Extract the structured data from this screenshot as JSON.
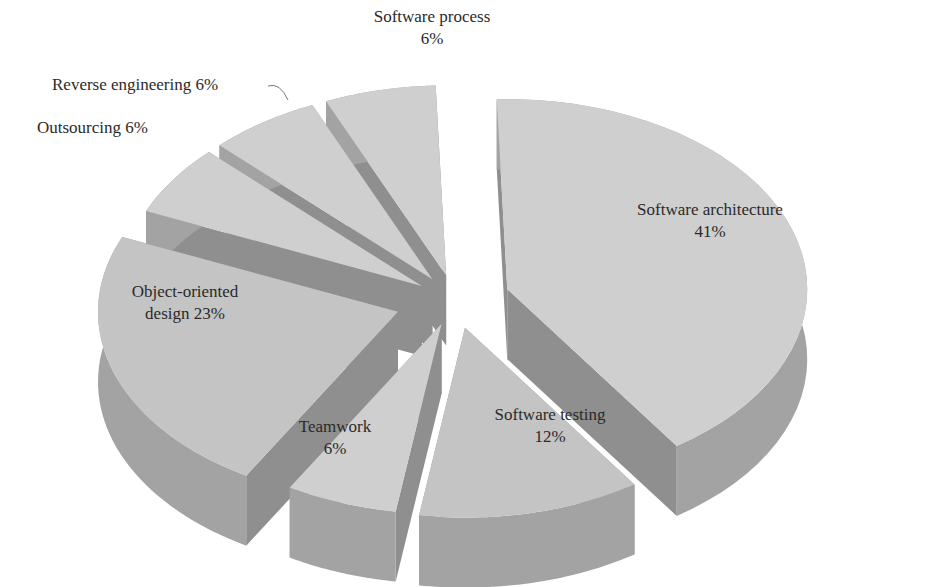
{
  "chart_data": {
    "type": "pie",
    "style": "3d-exploded",
    "title": "",
    "slices": [
      {
        "label": "Software architecture",
        "value": 41,
        "display": "Software architecture\n41%"
      },
      {
        "label": "Software testing",
        "value": 12,
        "display": "Software testing\n12%"
      },
      {
        "label": "Teamwork",
        "value": 6,
        "display": "Teamwork\n6%"
      },
      {
        "label": "Object-oriented design",
        "value": 23,
        "display": "Object-oriented\ndesign 23%"
      },
      {
        "label": "Outsourcing",
        "value": 6,
        "display": "Outsourcing 6%"
      },
      {
        "label": "Reverse engineering",
        "value": 6,
        "display": "Reverse engineering 6%"
      },
      {
        "label": "Software process",
        "value": 6,
        "display": "Software process\n6%"
      }
    ]
  },
  "labels": {
    "software_architecture": [
      "Software architecture",
      "41%"
    ],
    "software_testing": [
      "Software testing",
      "12%"
    ],
    "teamwork": [
      "Teamwork",
      "6%"
    ],
    "object_oriented": [
      "Object-oriented",
      "design 23%"
    ],
    "outsourcing": "Outsourcing 6%",
    "reverse_engineering": "Reverse engineering 6%",
    "software_process": [
      "Software process",
      "6%"
    ]
  },
  "colors": {
    "top_light": "#cfcfcf",
    "top_mid": "#c4c4c4",
    "side": "#a3a3a3",
    "side_dark": "#8f8f8f",
    "text": "#2a2a2a"
  }
}
